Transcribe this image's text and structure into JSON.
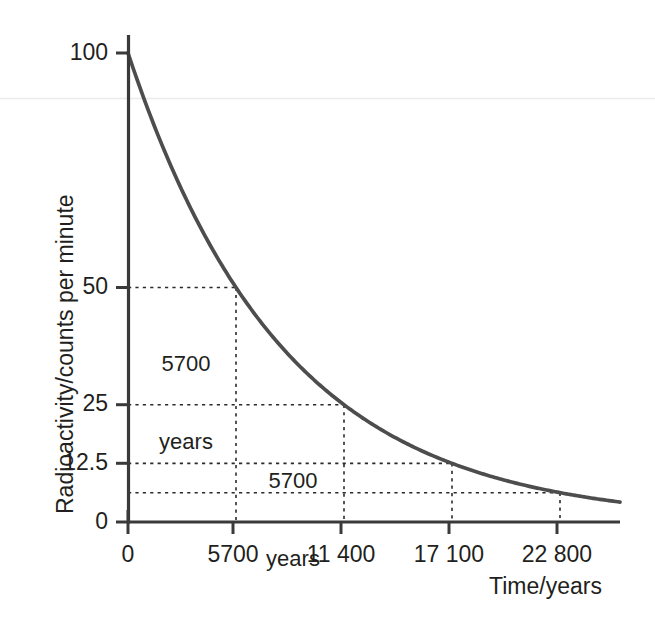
{
  "chart_data": {
    "type": "line",
    "title": "",
    "xlabel": "Time/years",
    "ylabel": "Radioactivity/counts per minute",
    "xlim": [
      0,
      26000
    ],
    "ylim": [
      0,
      107
    ],
    "grid": false,
    "legend": "none",
    "curve_color": "#4d4d4d",
    "axis_color": "#3a3a3a",
    "guide_color": "#2b2b2b",
    "series": [
      {
        "name": "Radioactive decay of carbon-14",
        "model": "exponential",
        "initial_value": 100,
        "half_life": 5700,
        "x": [
          0,
          1425,
          2850,
          4275,
          5700,
          7125,
          8550,
          9975,
          11400,
          12825,
          14250,
          15675,
          17100,
          18525,
          19950,
          21375,
          22800,
          24225,
          25650
        ],
        "y": [
          100,
          84.1,
          70.7,
          59.5,
          50,
          42.0,
          35.4,
          29.7,
          25,
          21.0,
          17.7,
          14.9,
          12.5,
          10.5,
          8.8,
          7.4,
          6.25,
          5.3,
          4.4
        ]
      }
    ],
    "x_ticks": [
      0,
      5700,
      11400,
      17100,
      22800
    ],
    "x_tick_labels": [
      "0",
      "5700",
      "11 400",
      "17 100",
      "22 800"
    ],
    "y_ticks": [
      0,
      12.5,
      25,
      50,
      100
    ],
    "y_tick_labels": [
      "0",
      "12.5",
      "25",
      "50",
      "100"
    ],
    "guide_points": [
      {
        "x": 5700,
        "y": 50
      },
      {
        "x": 11400,
        "y": 25
      },
      {
        "x": 17100,
        "y": 12.5
      },
      {
        "x": 22800,
        "y": 6.25
      }
    ],
    "annotations": [
      {
        "text_line1": "5700",
        "text_line2": "years",
        "x": 2850,
        "y": 41
      },
      {
        "text_line1": "5700",
        "text_line2": "years",
        "x": 8550,
        "y": 20
      }
    ]
  },
  "axis": {
    "x_title": "Time/years",
    "y_title": "Radioactivity/counts per minute"
  },
  "y_tick_labels": {
    "t100": "100",
    "t50": "50",
    "t25": "25",
    "t12_5": "12.5",
    "t0": "0"
  },
  "x_tick_labels": {
    "t0": "0",
    "t5700": "5700",
    "t11400": "11 400",
    "t17100": "17 100",
    "t22800": "22 800"
  },
  "annotations": {
    "first_halflife_line1": "5700",
    "first_halflife_line2": "years",
    "second_halflife_line1": "5700",
    "second_halflife_line2": "years"
  }
}
